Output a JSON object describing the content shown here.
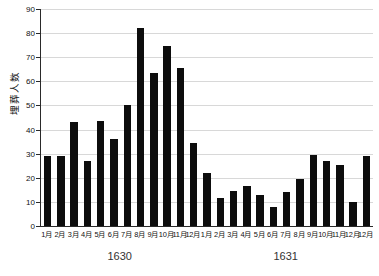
{
  "chart_data": {
    "type": "bar",
    "title": "",
    "xlabel": "",
    "ylabel": "埋葬人数",
    "ylim": [
      0,
      90
    ],
    "yticks": [
      0,
      10,
      20,
      30,
      40,
      50,
      60,
      70,
      80,
      90
    ],
    "grid": true,
    "legend": false,
    "bar_color": "#0d0d0d",
    "groups": [
      {
        "name": "1630",
        "categories": [
          "1月",
          "2月",
          "3月",
          "4月",
          "5月",
          "6月",
          "7月",
          "8月",
          "9月",
          "10月",
          "11月",
          "12月"
        ],
        "values": [
          29,
          29,
          43,
          27,
          43.5,
          36,
          50,
          82,
          63.5,
          74.5,
          65.5,
          34.5
        ]
      },
      {
        "name": "1631",
        "categories": [
          "1月",
          "2月",
          "3月",
          "4月",
          "5月",
          "6月",
          "7月",
          "8月",
          "9月",
          "10月",
          "11月",
          "12月"
        ],
        "values": [
          22,
          11.5,
          14.5,
          16.5,
          13,
          8,
          14,
          19.5,
          29.5,
          27,
          25.5,
          10
        ]
      }
    ],
    "categories": [
      "1月",
      "2月",
      "3月",
      "4月",
      "5月",
      "6月",
      "7月",
      "8月",
      "9月",
      "10月",
      "11月",
      "12月",
      "1月",
      "2月",
      "3月",
      "4月",
      "5月",
      "6月",
      "7月",
      "8月",
      "9月",
      "10月",
      "11月",
      "12月",
      "12月"
    ],
    "values": [
      29,
      29,
      43,
      27,
      43.5,
      36,
      50,
      82,
      63.5,
      74.5,
      65.5,
      34.5,
      22,
      11.5,
      14.5,
      16.5,
      13,
      8,
      14,
      19.5,
      29.5,
      27,
      25.5,
      10,
      29
    ],
    "group_labels": [
      "1630",
      "1631"
    ]
  }
}
